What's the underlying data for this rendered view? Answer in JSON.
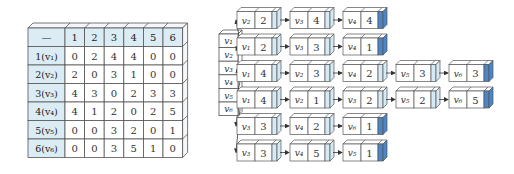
{
  "matrix": {
    "corner": "—",
    "col_headers": [
      "1",
      "2",
      "3",
      "4",
      "5",
      "6"
    ],
    "row_headers": [
      "1(v₁)",
      "2(v₂)",
      "3(v₃)",
      "4(v₄)",
      "5(v₅)",
      "6(v₆)"
    ],
    "cells": [
      [
        "0",
        "2",
        "4",
        "4",
        "0",
        "0"
      ],
      [
        "2",
        "0",
        "3",
        "1",
        "0",
        "0"
      ],
      [
        "4",
        "3",
        "0",
        "2",
        "3",
        "3"
      ],
      [
        "4",
        "1",
        "2",
        "0",
        "2",
        "5"
      ],
      [
        "0",
        "0",
        "3",
        "2",
        "0",
        "1"
      ],
      [
        "0",
        "0",
        "3",
        "5",
        "1",
        "0"
      ]
    ],
    "header_fill": "#dcecf5",
    "cell_fill": "#ffffff"
  },
  "vertex_array": [
    "v₁",
    "v₂",
    "v₃",
    "v₄",
    "v₅",
    "v₆"
  ],
  "adjacency_lists": [
    [
      {
        "v": "v₂",
        "w": "2"
      },
      {
        "v": "v₃",
        "w": "4"
      },
      {
        "v": "v₄",
        "w": "4"
      }
    ],
    [
      {
        "v": "v₁",
        "w": "2"
      },
      {
        "v": "v₃",
        "w": "3"
      },
      {
        "v": "v₄",
        "w": "1"
      }
    ],
    [
      {
        "v": "v₁",
        "w": "4"
      },
      {
        "v": "v₂",
        "w": "3"
      },
      {
        "v": "v₄",
        "w": "2"
      },
      {
        "v": "v₅",
        "w": "3"
      },
      {
        "v": "v₆",
        "w": "3"
      }
    ],
    [
      {
        "v": "v₁",
        "w": "4"
      },
      {
        "v": "v₂",
        "w": "1"
      },
      {
        "v": "v₃",
        "w": "2"
      },
      {
        "v": "v₅",
        "w": "2"
      },
      {
        "v": "v₆",
        "w": "5"
      }
    ],
    [
      {
        "v": "v₃",
        "w": "3"
      },
      {
        "v": "v₄",
        "w": "2"
      },
      {
        "v": "v₆",
        "w": "1"
      }
    ],
    [
      {
        "v": "v₃",
        "w": "3"
      },
      {
        "v": "v₄",
        "w": "5"
      },
      {
        "v": "v₅",
        "w": "1"
      }
    ]
  ],
  "colors": {
    "pointer_fill": "#d6eaf5",
    "null_pointer_fill": "#4a86c8",
    "stroke": "#555555"
  }
}
